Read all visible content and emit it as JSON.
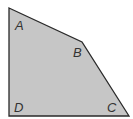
{
  "figure": {
    "shape": "quadrilateral",
    "fill_color": "#c6c6c6",
    "stroke_color": "#2a2a2a",
    "vertices": [
      {
        "label": "A"
      },
      {
        "label": "B"
      },
      {
        "label": "C"
      },
      {
        "label": "D"
      }
    ]
  }
}
